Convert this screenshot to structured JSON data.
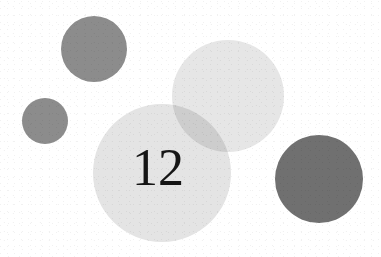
{
  "page": {
    "background_color": "#ffffff",
    "width": 381,
    "height": 257
  },
  "number_label": {
    "text": "12",
    "color": "#151515",
    "font_size_px": 52,
    "x": 132,
    "y": 142
  },
  "shapes": [
    {
      "name": "circle-dark-top-left",
      "shape": "circle",
      "cx": 94,
      "cy": 49,
      "r": 33,
      "color": "#8c8c8c",
      "tone": "medium-gray"
    },
    {
      "name": "circle-dark-small-left",
      "shape": "circle",
      "cx": 45,
      "cy": 121,
      "r": 23,
      "color": "#8c8c8c",
      "tone": "medium-gray"
    },
    {
      "name": "circle-light-upper-right",
      "shape": "circle",
      "cx": 228,
      "cy": 96,
      "r": 56,
      "color": "#e6e6e6",
      "tone": "light-gray"
    },
    {
      "name": "circle-light-center",
      "shape": "circle",
      "cx": 162,
      "cy": 173,
      "r": 69,
      "color": "#e4e4e4",
      "tone": "light-gray"
    },
    {
      "name": "circle-dark-bottom-right",
      "shape": "circle",
      "cx": 319,
      "cy": 179,
      "r": 44,
      "color": "#707070",
      "tone": "dark-gray"
    }
  ],
  "overlaps": [
    {
      "name": "overlap-center-and-upper-right",
      "between": [
        "circle-light-center",
        "circle-light-upper-right"
      ],
      "color": "#d2d2d2"
    }
  ]
}
